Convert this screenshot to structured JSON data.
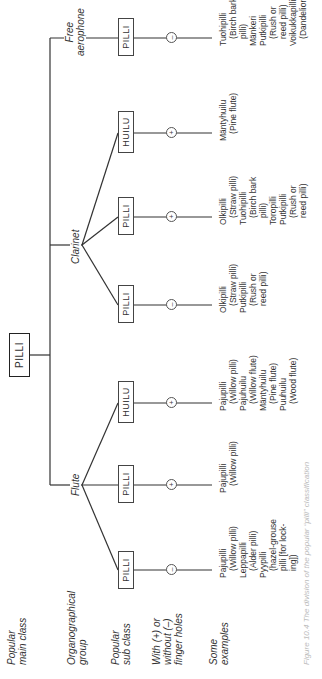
{
  "row_labels": {
    "main_class": "Popular\nmain class",
    "group": "Organographical\ngroup",
    "sub_class": "Popular\nsub class",
    "finger_holes": "With (+) or\nwithout (–)\nfinger holes",
    "examples": "Some\nexamples"
  },
  "root": {
    "label": "PILLI"
  },
  "groups": [
    {
      "name": "Flute"
    },
    {
      "name": "Clarinet"
    },
    {
      "name": "Free\naerophone"
    }
  ],
  "sub_classes": [
    {
      "label": "PILLI",
      "holes": "–",
      "examples": "Pajupilli\n   (Willow pilli)\nLeppapilli\n   (Alder pilli)\nPyypilli\n   (hazel-grouse\n   pilli [for lock-\n   ing])"
    },
    {
      "label": "PILLI",
      "holes": "+",
      "examples": "Pajupilli\n   (Willow pilli)"
    },
    {
      "label": "HUILU",
      "holes": "+",
      "examples": "Pajupilli\n   (Willow pilli)\nPajuhuilu\n   (Willow flute)\nMäntyhuilu\n   (Pine flute)\nPuuhuilu\n   (Wood flute)"
    },
    {
      "label": "PILLI",
      "holes": "–",
      "examples": "Olkipilli\n   (Straw pilli)\nPutkipilli\n   (Rush or\n   reed pilli)"
    },
    {
      "label": "PILLI",
      "holes": "+",
      "examples": "Olkipilli\n   (Straw pilli)\nTuohipilli\n   (Birch bark\n   pilli)\nToropilli\nPutkipilli\n   (Rush or\n   reed pilli)"
    },
    {
      "label": "HUILU",
      "holes": "+",
      "examples": "Mäntyhuilu\n   (Pine flute)"
    },
    {
      "label": "PILLI",
      "holes": "–",
      "examples": "Tuohipilli\n   (Birch bark\n   pilli)\nMänkeri\nPutkipilli\n   (Rush or\n   reed pilli)\nVoikukkapilli\n   (Dandelion pilli)"
    }
  ],
  "caption": "Figure 10.4 The division of the popular “pilli” classification"
}
